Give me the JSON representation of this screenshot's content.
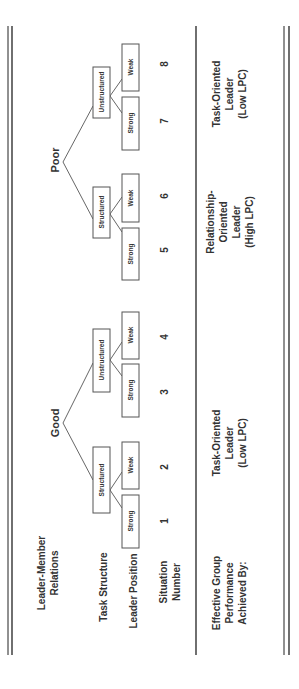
{
  "row_labels": {
    "relations": [
      "Leader-Member",
      "Relations"
    ],
    "task_structure": "Task Structure",
    "leader_position": "Leader Position",
    "situation": [
      "Situation",
      "Number"
    ],
    "effective": [
      "Effective Group",
      "Performance",
      "Achieved By:"
    ]
  },
  "relations": {
    "good": "Good",
    "poor": "Poor"
  },
  "task_structure": {
    "structured": "Structured",
    "unstructured": "Unstructured"
  },
  "leader_position": {
    "strong": "Strong",
    "weak": "Weak"
  },
  "situations": [
    "1",
    "2",
    "3",
    "4",
    "5",
    "6",
    "7",
    "8"
  ],
  "outcomes": {
    "task_low_1": [
      "Task-Oriented",
      "Leader",
      "(Low LPC)"
    ],
    "relationship_high": [
      "Relationship-",
      "Oriented",
      "Leader",
      "(High LPC)"
    ],
    "task_low_2": [
      "Task-Oriented",
      "Leader",
      "(Low LPC)"
    ]
  }
}
